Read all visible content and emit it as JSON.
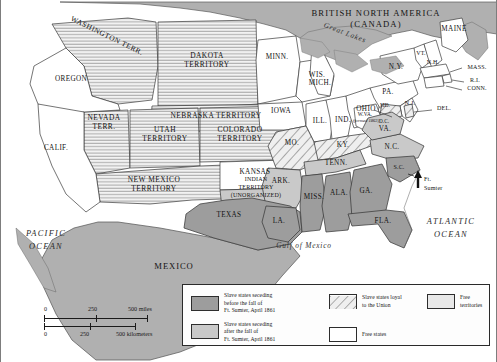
{
  "map": {
    "title_country": "BRITISH NORTH AMERICA",
    "title_country_alt": "(CANADA)",
    "great_lakes": "Great Lakes",
    "mexico": "MEXICO",
    "gulf": "Gulf of Mexico",
    "pacific_line1": "PACIFIC",
    "pacific_line2": "OCEAN",
    "atlantic_line1": "ATLANTIC",
    "atlantic_line2": "OCEAN",
    "ft_sumter_line1": "Ft.",
    "ft_sumter_line2": "Sumter",
    "wva_note": "(formed 1863)"
  },
  "colors": {
    "seceded_before": "#9d9d9d",
    "seceded_after": "#c9c9c9",
    "loyal_slave_hatch": "#d8d8d8",
    "free_state": "#ffffff",
    "free_territory": "#e8e8e8",
    "foreign": "#b0b0b0",
    "water": "#ffffff",
    "outline": "#3a3a3a"
  },
  "regions": [
    {
      "name": "OREGON",
      "category": "free_state",
      "lines": [
        "OREGON"
      ]
    },
    {
      "name": "CALIF.",
      "category": "free_state",
      "lines": [
        "CALIF."
      ]
    },
    {
      "name": "WASHINGTON TERR.",
      "category": "free_territory",
      "lines": [
        "WASHINGTON TERR."
      ]
    },
    {
      "name": "NEVADA TERR.",
      "category": "free_territory",
      "lines": [
        "NEVADA",
        "TERR."
      ]
    },
    {
      "name": "UTAH TERRITORY",
      "category": "free_territory",
      "lines": [
        "UTAH",
        "TERRITORY"
      ]
    },
    {
      "name": "COLORADO TERRITORY",
      "category": "free_territory",
      "lines": [
        "COLORADO",
        "TERRITORY"
      ]
    },
    {
      "name": "DAKOTA TERRITORY",
      "category": "free_territory",
      "lines": [
        "DAKOTA",
        "TERRITORY"
      ]
    },
    {
      "name": "NEBRASKA TERRITORY",
      "category": "free_territory",
      "lines": [
        "NEBRASKA TERRITORY"
      ]
    },
    {
      "name": "NEW MEXICO TERRITORY",
      "category": "free_territory",
      "lines": [
        "NEW MEXICO",
        "TERRITORY"
      ]
    },
    {
      "name": "INDIAN TERRITORY (UNORGANIZED)",
      "category": "seceded_after",
      "lines": [
        "INDIAN",
        "TERRITORY",
        "(UNORGANIZED)"
      ]
    },
    {
      "name": "MINN.",
      "category": "free_state",
      "lines": [
        "MINN."
      ]
    },
    {
      "name": "WIS.",
      "category": "free_state",
      "lines": [
        "WIS."
      ]
    },
    {
      "name": "IOWA",
      "category": "free_state",
      "lines": [
        "IOWA"
      ]
    },
    {
      "name": "KANSAS",
      "category": "free_state",
      "lines": [
        "KANSAS"
      ]
    },
    {
      "name": "MICH.",
      "category": "free_state",
      "lines": [
        "MICH."
      ]
    },
    {
      "name": "ILL.",
      "category": "free_state",
      "lines": [
        "ILL."
      ]
    },
    {
      "name": "IND.",
      "category": "free_state",
      "lines": [
        "IND."
      ]
    },
    {
      "name": "OHIO",
      "category": "free_state",
      "lines": [
        "OHIO"
      ]
    },
    {
      "name": "PA.",
      "category": "free_state",
      "lines": [
        "PA."
      ]
    },
    {
      "name": "N.Y.",
      "category": "free_state",
      "lines": [
        "N.Y."
      ]
    },
    {
      "name": "MAINE",
      "category": "free_state",
      "lines": [
        "MAINE"
      ]
    },
    {
      "name": "VT.",
      "category": "free_state",
      "lines": [
        "VT."
      ]
    },
    {
      "name": "N.H.",
      "category": "free_state",
      "lines": [
        "N.H."
      ]
    },
    {
      "name": "MASS.",
      "category": "free_state",
      "lines": [
        "MASS."
      ]
    },
    {
      "name": "R.I.",
      "category": "free_state",
      "lines": [
        "R.I."
      ]
    },
    {
      "name": "CONN.",
      "category": "free_state",
      "lines": [
        "CONN."
      ]
    },
    {
      "name": "N.J.",
      "category": "free_state",
      "lines": [
        "N.J."
      ]
    },
    {
      "name": "DEL.",
      "category": "loyal_slave",
      "lines": [
        "DEL."
      ]
    },
    {
      "name": "MD.",
      "category": "loyal_slave",
      "lines": [
        "MD."
      ]
    },
    {
      "name": "D.C.",
      "category": "loyal_slave",
      "lines": [
        "D.C."
      ]
    },
    {
      "name": "W.VA.",
      "category": "free_state",
      "lines": [
        "W.VA."
      ]
    },
    {
      "name": "MO.",
      "category": "loyal_slave",
      "lines": [
        "MO."
      ]
    },
    {
      "name": "KY.",
      "category": "loyal_slave",
      "lines": [
        "KY."
      ]
    },
    {
      "name": "VA.",
      "category": "seceded_after",
      "lines": [
        "VA."
      ]
    },
    {
      "name": "N.C.",
      "category": "seceded_after",
      "lines": [
        "N.C."
      ]
    },
    {
      "name": "TENN.",
      "category": "seceded_after",
      "lines": [
        "TENN."
      ]
    },
    {
      "name": "ARK.",
      "category": "seceded_after",
      "lines": [
        "ARK."
      ]
    },
    {
      "name": "S.C.",
      "category": "seceded_before",
      "lines": [
        "S.C."
      ]
    },
    {
      "name": "GA.",
      "category": "seceded_before",
      "lines": [
        "GA."
      ]
    },
    {
      "name": "FLA.",
      "category": "seceded_before",
      "lines": [
        "FLA."
      ]
    },
    {
      "name": "ALA.",
      "category": "seceded_before",
      "lines": [
        "ALA."
      ]
    },
    {
      "name": "MISS.",
      "category": "seceded_before",
      "lines": [
        "MISS."
      ]
    },
    {
      "name": "LA.",
      "category": "seceded_before",
      "lines": [
        "LA."
      ]
    },
    {
      "name": "TEXAS",
      "category": "seceded_before",
      "lines": [
        "TEXAS"
      ]
    }
  ],
  "legend": {
    "items": [
      {
        "swatch": "seceded_before",
        "lines": [
          "Slave states seceding",
          "before the fall of",
          "Ft. Sumter, April 1861"
        ]
      },
      {
        "swatch": "seceded_after",
        "lines": [
          "Slave states seceding",
          "after the fall of",
          "Ft. Sumter, April 1861"
        ]
      },
      {
        "swatch": "loyal_slave_hatch",
        "lines": [
          "Slave states loyal",
          "to the Union"
        ]
      },
      {
        "swatch": "free_state",
        "lines": [
          "Free states"
        ]
      },
      {
        "swatch": "free_territory",
        "lines": [
          "Free territories"
        ]
      }
    ]
  },
  "scale": {
    "miles_ticks": [
      "0",
      "250",
      "500 miles"
    ],
    "km_ticks": [
      "0",
      "250",
      "500 kilometers"
    ]
  }
}
